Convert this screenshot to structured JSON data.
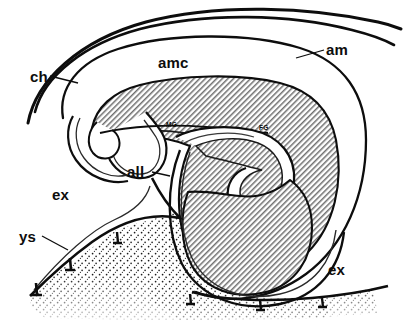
{
  "figure": {
    "kind": "line-drawing",
    "background_color": "#ffffff",
    "ink_color": "#0d0d0d",
    "hatch_fill_color": "#9a9a9a",
    "stipple_fill_color": "#2b2b2b"
  },
  "labels": {
    "ch": "ch",
    "am": "am",
    "amc": "amc",
    "all": "all",
    "ex_left": "ex",
    "ex_right": "ex",
    "ys": "ys",
    "mg": "MG",
    "fg": "FG"
  },
  "regions": {
    "embryo_hatched": "embryo-body-hatched-region",
    "amniotic_cavity": "amniotic-cavity-void",
    "yolk_sac_stipple": "yolk-sac-stippled-region",
    "allantois_lumen": "allantois-lumen-void",
    "foregut_lumen": "foregut-lumen-void",
    "midgut_lumen": "midgut-lumen-void"
  },
  "leaders": {
    "ch": "leader-line-ch",
    "am": "leader-line-am",
    "all": "leader-line-all",
    "ys": "leader-line-ys"
  }
}
